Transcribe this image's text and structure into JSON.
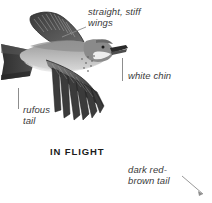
{
  "plate": {
    "caption": "IN FLIGHT",
    "subject": "bird-in-flight-illustration",
    "background_color": "#ffffff",
    "text_color": "#3a3a3a",
    "caption_color": "#1c1c1c",
    "leader_color": "#8d8d8d"
  },
  "labels": {
    "wings": "straight, stiff\nwings",
    "white_chin": "white chin",
    "rufous_tail": "rufous\ntail",
    "dark_tail": "dark red-\nbrown tail"
  },
  "illustration": {
    "name": "bird-in-flight",
    "orientation": "facing-right",
    "palette": {
      "dark": "#3c3c3c",
      "mid": "#6f6f6f",
      "light": "#b9b9b9",
      "pale": "#dcdcdc",
      "outline": "#2b2b2b"
    }
  }
}
